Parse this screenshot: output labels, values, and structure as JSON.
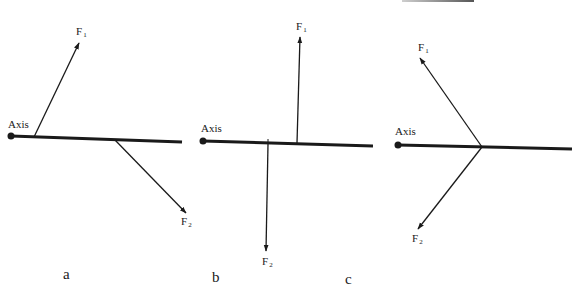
{
  "figure": {
    "colors": {
      "ink": "#1a1a1a",
      "background": "#ffffff"
    },
    "panels": [
      {
        "id": "a",
        "label": "a",
        "axis_label": "Axis",
        "force1": {
          "name": "F",
          "sub": "1",
          "direction": "up-right"
        },
        "force2": {
          "name": "F",
          "sub": "2",
          "direction": "down-right"
        }
      },
      {
        "id": "b",
        "label": "b",
        "axis_label": "Axis",
        "force1": {
          "name": "F",
          "sub": "1",
          "direction": "up"
        },
        "force2": {
          "name": "F",
          "sub": "2",
          "direction": "down"
        }
      },
      {
        "id": "c",
        "label": "c",
        "axis_label": "Axis",
        "force1": {
          "name": "F",
          "sub": "1",
          "direction": "up-left"
        },
        "force2": {
          "name": "F",
          "sub": "2",
          "direction": "down-left"
        }
      }
    ]
  }
}
